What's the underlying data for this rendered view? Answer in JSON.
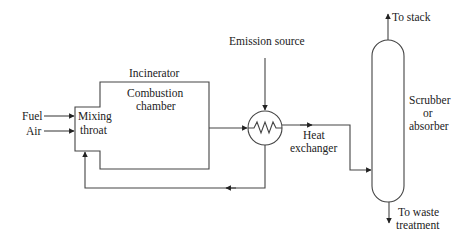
{
  "diagram": {
    "labels": {
      "fuel": "Fuel",
      "air": "Air",
      "mixing_throat_line1": "Mixing",
      "mixing_throat_line2": "throat",
      "incinerator": "Incinerator",
      "combustion_line1": "Combustion",
      "combustion_line2": "chamber",
      "emission_source": "Emission source",
      "heat_exchanger_line1": "Heat",
      "heat_exchanger_line2": "exchanger",
      "scrubber_line1": "Scrubber",
      "scrubber_line2": "or",
      "scrubber_line3": "absorber",
      "to_stack": "To stack",
      "to_waste_line1": "To waste",
      "to_waste_line2": "treatment"
    },
    "colors": {
      "line": "#444444",
      "text": "#222222",
      "background": "#ffffff"
    }
  }
}
